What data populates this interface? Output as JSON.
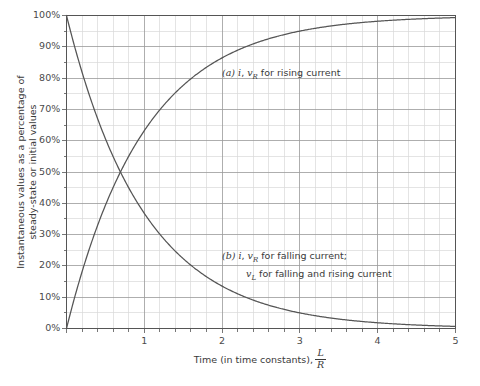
{
  "chart_data": {
    "type": "line",
    "title": "",
    "xlabel": "Time (in time constants), L/R",
    "xlabel_text": "Time (in time constants),",
    "xlabel_frac_num": "L",
    "xlabel_frac_den": "R",
    "ylabel": "Instantaneous values as a percentage of steady-state or initial values",
    "ylabel_line1": "Instantaneous values as a percentage of",
    "ylabel_line2": "steady-state or initial values",
    "xlim": [
      0,
      5
    ],
    "ylim": [
      0,
      100
    ],
    "xticks": [
      0,
      1,
      2,
      3,
      4,
      5
    ],
    "xtick_labels": [
      "",
      "1",
      "2",
      "3",
      "4",
      "5"
    ],
    "yticks": [
      0,
      10,
      20,
      30,
      40,
      50,
      60,
      70,
      80,
      90,
      100
    ],
    "ytick_labels": [
      "0%",
      "10%",
      "20%",
      "30%",
      "40%",
      "50%",
      "60%",
      "70%",
      "80%",
      "90%",
      "100%"
    ],
    "grid": true,
    "grid_major_x_step": 1,
    "grid_minor_x_step": 0.2,
    "grid_major_y_step": 10,
    "grid_minor_y_step": 5,
    "grid_major_color": "#9a9a9a",
    "grid_minor_color": "#d8d8d8",
    "axis_color": "#555555",
    "curve_color": "#555555",
    "legend_position": "inline-annotations",
    "series": [
      {
        "name": "rising",
        "label": "(a) i, vR for rising current",
        "formula": "100*(1-exp(-t))",
        "color": "#555555",
        "x": [
          0,
          0.1,
          0.2,
          0.3,
          0.4,
          0.5,
          0.6,
          0.7,
          0.8,
          0.9,
          1.0,
          1.2,
          1.4,
          1.6,
          1.8,
          2.0,
          2.2,
          2.4,
          2.6,
          2.8,
          3.0,
          3.2,
          3.4,
          3.6,
          3.8,
          4.0,
          4.2,
          4.4,
          4.6,
          4.8,
          5.0
        ],
        "y": [
          0,
          9.5,
          18.1,
          25.9,
          33.0,
          39.3,
          45.1,
          50.3,
          55.1,
          59.3,
          63.2,
          69.9,
          75.3,
          79.8,
          83.5,
          86.5,
          88.9,
          90.9,
          92.6,
          93.9,
          95.0,
          95.9,
          96.7,
          97.3,
          97.8,
          98.2,
          98.5,
          98.8,
          99.0,
          99.2,
          99.3
        ]
      },
      {
        "name": "falling",
        "label": "(b) i, vR for falling current; vL for falling and rising current",
        "formula": "100*exp(-t)",
        "color": "#555555",
        "x": [
          0,
          0.1,
          0.2,
          0.3,
          0.4,
          0.5,
          0.6,
          0.7,
          0.8,
          0.9,
          1.0,
          1.2,
          1.4,
          1.6,
          1.8,
          2.0,
          2.2,
          2.4,
          2.6,
          2.8,
          3.0,
          3.2,
          3.4,
          3.6,
          3.8,
          4.0,
          4.2,
          4.4,
          4.6,
          4.8,
          5.0
        ],
        "y": [
          100,
          90.5,
          81.9,
          74.1,
          67.0,
          60.7,
          54.9,
          49.7,
          44.9,
          40.7,
          36.8,
          30.1,
          24.7,
          20.2,
          16.5,
          13.5,
          11.1,
          9.1,
          7.4,
          6.1,
          5.0,
          4.1,
          3.3,
          2.7,
          2.2,
          1.8,
          1.5,
          1.2,
          1.0,
          0.8,
          0.7
        ]
      }
    ],
    "annotations": [
      {
        "id": "a",
        "marker": "(a)",
        "line1_pre": "i",
        "line1_sep": ", ",
        "line1_sym": "v",
        "line1_sub": "R",
        "line1_post": " for rising current"
      },
      {
        "id": "b",
        "marker": "(b)",
        "line1_pre": "i",
        "line1_sep": ", ",
        "line1_sym": "v",
        "line1_sub": "R",
        "line1_post": " for falling current;",
        "line2_sym": "v",
        "line2_sub": "L",
        "line2_post": " for falling and rising current"
      }
    ]
  }
}
